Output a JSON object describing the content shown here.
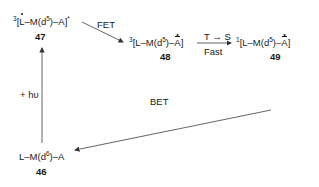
{
  "species": {
    "s47": {
      "prefix": "3",
      "L": "L",
      "M": "–M(d",
      "d": "5",
      "close": ")–A]",
      "star": "*",
      "number": "47"
    },
    "s48": {
      "prefix": "3",
      "open": "[L–M(d",
      "d": "5",
      "mid": ")–",
      "A": "A",
      "close": "]",
      "number": "48"
    },
    "s49": {
      "prefix": "1",
      "open": "[L–M(d",
      "d": "5",
      "mid": ")–",
      "A": "A",
      "close": "]",
      "number": "49"
    },
    "s46": {
      "open": "L–M(d",
      "d": "6",
      "close": ")–A",
      "number": "46"
    }
  },
  "arrows": {
    "fet": {
      "label": "FET"
    },
    "isc": {
      "label_top": "T → S",
      "label_bottom": "Fast"
    },
    "bet": {
      "label": "BET"
    },
    "excite": {
      "label": "+ hυ"
    }
  }
}
